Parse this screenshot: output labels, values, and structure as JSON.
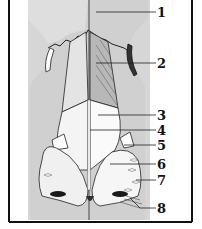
{
  "figure": {
    "colors": {
      "background_panel": "#d4d4d4",
      "line": "#1a1a1a",
      "frame": "#111111",
      "page": "#ffffff"
    },
    "labels": [
      {
        "id": "1",
        "text": "1",
        "y": 12
      },
      {
        "id": "2",
        "text": "2",
        "y": 63
      },
      {
        "id": "3",
        "text": "3",
        "y": 115
      },
      {
        "id": "4",
        "text": "4",
        "y": 130
      },
      {
        "id": "5",
        "text": "5",
        "y": 145
      },
      {
        "id": "6",
        "text": "6",
        "y": 164
      },
      {
        "id": "7",
        "text": "7",
        "y": 180
      },
      {
        "id": "8",
        "text": "8",
        "y": 208
      }
    ]
  }
}
